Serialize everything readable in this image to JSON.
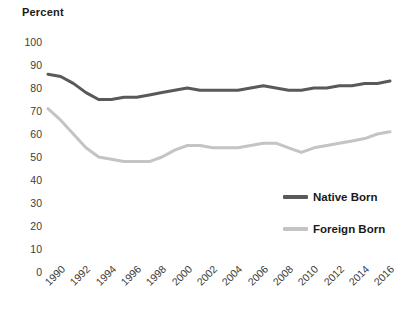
{
  "chart_data": {
    "type": "line",
    "title": "Percent",
    "xlabel": "",
    "ylabel": "Percent",
    "ylim": [
      0,
      100
    ],
    "ytick_step": 10,
    "grid": false,
    "legend_position": "inside-right",
    "xlim": [
      1990,
      2017
    ],
    "yticks": [
      "100",
      "90",
      "80",
      "70",
      "60",
      "50",
      "40",
      "30",
      "20",
      "10",
      "0"
    ],
    "categories": [
      1990,
      1991,
      1992,
      1993,
      1994,
      1995,
      1996,
      1997,
      1998,
      1999,
      2000,
      2001,
      2002,
      2003,
      2004,
      2005,
      2006,
      2007,
      2008,
      2009,
      2010,
      2011,
      2012,
      2013,
      2014,
      2015,
      2016,
      2017
    ],
    "xtick_labels": [
      "1990",
      "1992",
      "1994",
      "1996",
      "1998",
      "2000",
      "2002",
      "2004",
      "2006",
      "2008",
      "2010",
      "2012",
      "2014",
      "2016"
    ],
    "series": [
      {
        "name": "Native Born",
        "color": "#595959",
        "values": [
          86,
          85,
          82,
          78,
          75,
          75,
          76,
          76,
          77,
          78,
          79,
          80,
          79,
          79,
          79,
          79,
          80,
          81,
          80,
          79,
          79,
          80,
          80,
          81,
          81,
          82,
          82,
          83
        ]
      },
      {
        "name": "Foreign Born",
        "color": "#c4c4c4",
        "values": [
          71,
          66,
          60,
          54,
          50,
          49,
          48,
          48,
          48,
          50,
          53,
          55,
          55,
          54,
          54,
          54,
          55,
          56,
          56,
          54,
          52,
          54,
          55,
          56,
          57,
          58,
          60,
          61
        ]
      }
    ]
  },
  "legend": {
    "items": [
      {
        "label": "Native Born",
        "color": "#595959"
      },
      {
        "label": "Foreign Born",
        "color": "#c4c4c4"
      }
    ]
  }
}
